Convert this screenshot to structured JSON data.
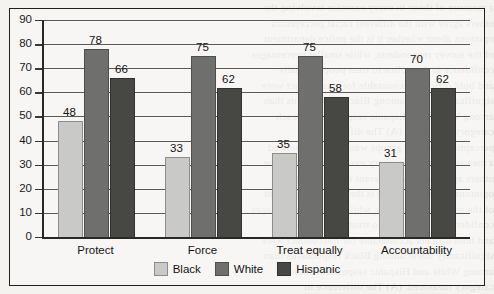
{
  "chart_data": {
    "type": "bar",
    "title": "",
    "subtitle": "",
    "xlabel": "",
    "ylabel": "",
    "categories": [
      "Protect",
      "Force",
      "Treat equally",
      "Accountability"
    ],
    "series": [
      {
        "name": "Black",
        "color": "#c9c9c7",
        "values": [
          48,
          33,
          35,
          31
        ]
      },
      {
        "name": "White",
        "color": "#6f6f6d",
        "values": [
          78,
          75,
          75,
          70
        ]
      },
      {
        "name": "Hispanic",
        "color": "#474744",
        "values": [
          66,
          62,
          58,
          62
        ]
      }
    ],
    "ylim": [
      0,
      90
    ],
    "ytick_step": 10,
    "yticks": [
      0,
      10,
      20,
      30,
      40,
      50,
      60,
      70,
      80,
      90
    ],
    "grid": true,
    "grid_axis": "y",
    "legend_position": "bottom-center",
    "data_labels": true,
    "orientation": "vertical",
    "grouping": "clustered"
  },
  "figure": {
    "background_color": "#f4f3f0",
    "frame_color": "#231f1c",
    "gridline_color": "#5d5a55",
    "axis_color": "#2a2724",
    "text_color": "#141312"
  },
  "bleed_text": [
    "a measure of those in every exercise involving the",
    "others agree with the different racial perceptions",
    "opinions about whether it is the police department",
    "of the survey respondents, while smaller percentages",
    "confidence in the police to treat people equally",
    "and hold officers accountable for misconduct were",
    "significantly lower among Black respondents than",
    "among White and Hispanic respondents in each",
    "category measured. (A) The difference in",
    "perception between groups was most pronounced"
  ]
}
